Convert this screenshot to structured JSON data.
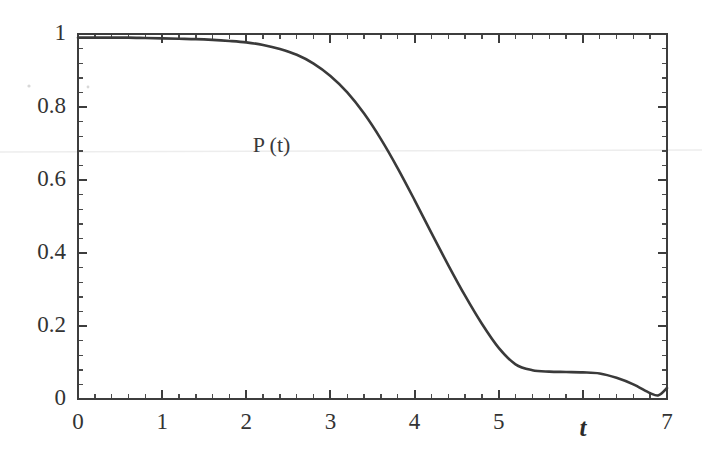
{
  "chart_data": {
    "type": "line",
    "title": "",
    "subtitle": "",
    "xlabel": "t",
    "ylabel": "",
    "xlim": [
      0,
      7
    ],
    "ylim": [
      0,
      1
    ],
    "grid": false,
    "legend": null,
    "annotations": [
      {
        "text": "P (t)",
        "x": 2.3,
        "y": 0.69
      }
    ],
    "x_ticks": [
      {
        "value": 0,
        "label": "0"
      },
      {
        "value": 1,
        "label": "1"
      },
      {
        "value": 2,
        "label": "2"
      },
      {
        "value": 3,
        "label": "3"
      },
      {
        "value": 4,
        "label": "4"
      },
      {
        "value": 5,
        "label": "5"
      },
      {
        "value": 6,
        "label": ""
      },
      {
        "value": 7,
        "label": "7"
      }
    ],
    "y_ticks": [
      {
        "value": 0,
        "label": "0"
      },
      {
        "value": 0.2,
        "label": "0.2"
      },
      {
        "value": 0.4,
        "label": "0.4"
      },
      {
        "value": 0.6,
        "label": "0.6"
      },
      {
        "value": 0.8,
        "label": "0.8"
      },
      {
        "value": 1,
        "label": "1"
      }
    ],
    "x_minor_tick_count": 4,
    "y_minor_tick_count": 4,
    "series": [
      {
        "name": "P (t)",
        "color": "#3a3a3a",
        "x": [
          0.0,
          0.2,
          0.4,
          0.6,
          0.8,
          1.0,
          1.2,
          1.4,
          1.6,
          1.8,
          2.0,
          2.2,
          2.4,
          2.6,
          2.8,
          3.0,
          3.2,
          3.4,
          3.6,
          3.8,
          4.0,
          4.2,
          4.4,
          4.6,
          4.8,
          5.0,
          5.2,
          5.4,
          5.6,
          5.8,
          6.0,
          6.2,
          6.4,
          6.6,
          6.8,
          6.9,
          7.0
        ],
        "y": [
          0.99,
          0.99,
          0.99,
          0.99,
          0.989,
          0.988,
          0.987,
          0.986,
          0.984,
          0.981,
          0.977,
          0.97,
          0.959,
          0.943,
          0.919,
          0.885,
          0.84,
          0.782,
          0.712,
          0.632,
          0.545,
          0.455,
          0.367,
          0.283,
          0.206,
          0.14,
          0.095,
          0.079,
          0.075,
          0.074,
          0.073,
          0.07,
          0.058,
          0.04,
          0.016,
          0.01,
          0.03
        ]
      }
    ]
  },
  "axis": {
    "x_axis_label": "t",
    "curve_label": "P (t)"
  },
  "colors": {
    "curve": "#3a3a3a",
    "frame": "#3d3d3d",
    "text": "#333333",
    "background": "#ffffff"
  }
}
